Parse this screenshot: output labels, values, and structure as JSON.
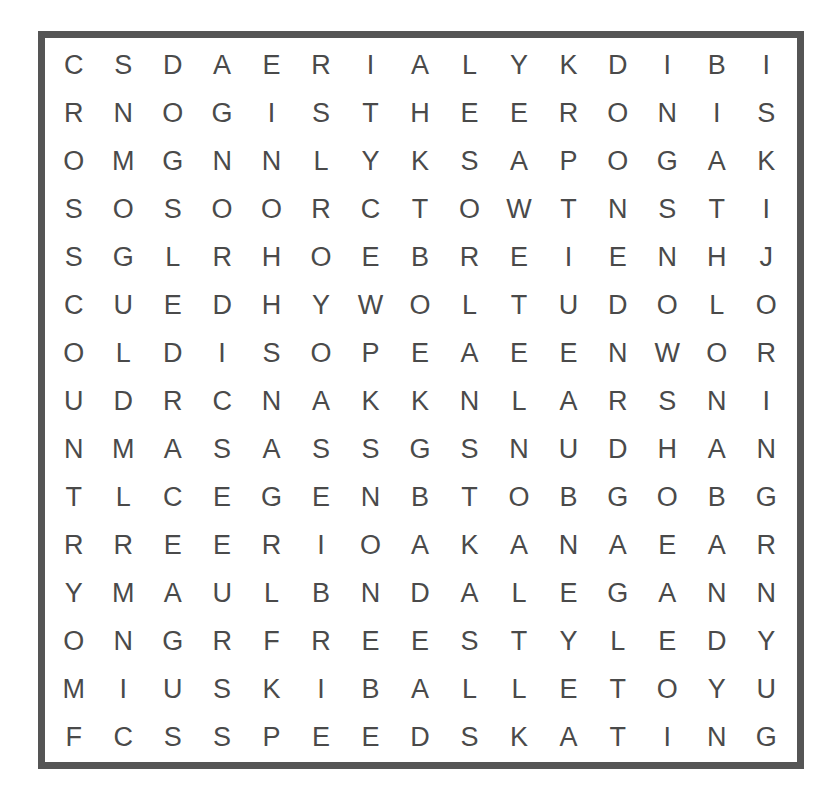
{
  "puzzle": {
    "type": "word-search",
    "rows": 15,
    "cols": 15,
    "grid": [
      [
        "C",
        "S",
        "D",
        "A",
        "E",
        "R",
        "I",
        "A",
        "L",
        "Y",
        "K",
        "D",
        "I",
        "B",
        "I"
      ],
      [
        "R",
        "N",
        "O",
        "G",
        "I",
        "S",
        "T",
        "H",
        "E",
        "E",
        "R",
        "O",
        "N",
        "I",
        "S"
      ],
      [
        "O",
        "M",
        "G",
        "N",
        "N",
        "L",
        "Y",
        "K",
        "S",
        "A",
        "P",
        "O",
        "G",
        "A",
        "K"
      ],
      [
        "S",
        "O",
        "S",
        "O",
        "O",
        "R",
        "C",
        "T",
        "O",
        "W",
        "T",
        "N",
        "S",
        "T",
        "I"
      ],
      [
        "S",
        "G",
        "L",
        "R",
        "H",
        "O",
        "E",
        "B",
        "R",
        "E",
        "I",
        "E",
        "N",
        "H",
        "J"
      ],
      [
        "C",
        "U",
        "E",
        "D",
        "H",
        "Y",
        "W",
        "O",
        "L",
        "T",
        "U",
        "D",
        "O",
        "L",
        "O"
      ],
      [
        "O",
        "L",
        "D",
        "I",
        "S",
        "O",
        "P",
        "E",
        "A",
        "E",
        "E",
        "N",
        "W",
        "O",
        "R"
      ],
      [
        "U",
        "D",
        "R",
        "C",
        "N",
        "A",
        "K",
        "K",
        "N",
        "L",
        "A",
        "R",
        "S",
        "N",
        "I"
      ],
      [
        "N",
        "M",
        "A",
        "S",
        "A",
        "S",
        "S",
        "G",
        "S",
        "N",
        "U",
        "D",
        "H",
        "A",
        "N"
      ],
      [
        "T",
        "L",
        "C",
        "E",
        "G",
        "E",
        "N",
        "B",
        "T",
        "O",
        "B",
        "G",
        "O",
        "B",
        "G"
      ],
      [
        "R",
        "R",
        "E",
        "E",
        "R",
        "I",
        "O",
        "A",
        "K",
        "A",
        "N",
        "A",
        "E",
        "A",
        "R"
      ],
      [
        "Y",
        "M",
        "A",
        "U",
        "L",
        "B",
        "N",
        "D",
        "A",
        "L",
        "E",
        "G",
        "A",
        "N",
        "N"
      ],
      [
        "O",
        "N",
        "G",
        "R",
        "F",
        "R",
        "E",
        "E",
        "S",
        "T",
        "Y",
        "L",
        "E",
        "D",
        "Y"
      ],
      [
        "M",
        "I",
        "U",
        "S",
        "K",
        "I",
        "B",
        "A",
        "L",
        "L",
        "E",
        "T",
        "O",
        "Y",
        "U"
      ],
      [
        "F",
        "C",
        "S",
        "S",
        "P",
        "E",
        "E",
        "D",
        "S",
        "K",
        "A",
        "T",
        "I",
        "N",
        "G"
      ]
    ]
  },
  "colors": {
    "border": "#555555",
    "letters": "#4a4a4a",
    "background": "#ffffff"
  }
}
